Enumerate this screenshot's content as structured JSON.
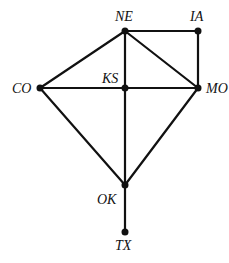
{
  "diagram": {
    "type": "graph",
    "nodes": [
      {
        "id": "NE",
        "label": "NE",
        "x": 125,
        "y": 31
      },
      {
        "id": "IA",
        "label": "IA",
        "x": 198,
        "y": 31
      },
      {
        "id": "CO",
        "label": "CO",
        "x": 40,
        "y": 88
      },
      {
        "id": "KS",
        "label": "KS",
        "x": 125,
        "y": 88
      },
      {
        "id": "MO",
        "label": "MO",
        "x": 198,
        "y": 88
      },
      {
        "id": "OK",
        "label": "OK",
        "x": 125,
        "y": 185
      },
      {
        "id": "TX",
        "label": "TX",
        "x": 125,
        "y": 232
      }
    ],
    "edges": [
      [
        "NE",
        "IA"
      ],
      [
        "NE",
        "CO"
      ],
      [
        "NE",
        "KS"
      ],
      [
        "NE",
        "MO"
      ],
      [
        "IA",
        "MO"
      ],
      [
        "CO",
        "KS"
      ],
      [
        "KS",
        "MO"
      ],
      [
        "CO",
        "OK"
      ],
      [
        "KS",
        "OK"
      ],
      [
        "MO",
        "OK"
      ],
      [
        "OK",
        "TX"
      ]
    ],
    "colors": {
      "line": "#111111",
      "background": "#ffffff"
    }
  }
}
